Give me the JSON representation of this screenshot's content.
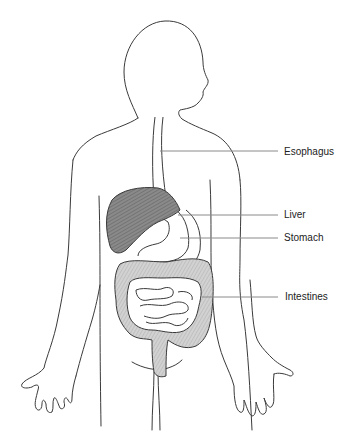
{
  "diagram": {
    "labels": [
      {
        "id": "esophagus",
        "text": "Esophagus",
        "x": 284,
        "y": 147
      },
      {
        "id": "liver",
        "text": "Liver",
        "x": 284,
        "y": 210
      },
      {
        "id": "stomach",
        "text": "Stomach",
        "x": 284,
        "y": 233
      },
      {
        "id": "intestines",
        "text": "Intestines",
        "x": 285,
        "y": 291
      }
    ],
    "colors": {
      "outline": "#3a3a3a",
      "leader_line": "#8a8a8a",
      "liver_fill": "#7d7d7d",
      "intestine_fill": "#c9c9c9",
      "background": "#ffffff"
    }
  }
}
